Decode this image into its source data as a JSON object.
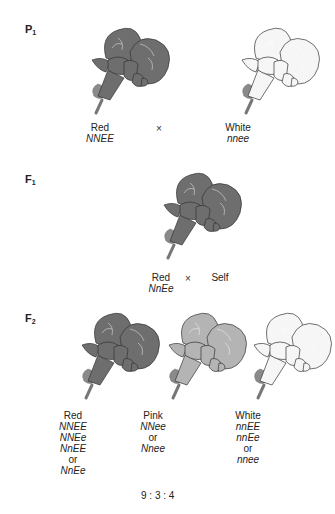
{
  "generations": {
    "p1": {
      "label": "P",
      "sub": "1"
    },
    "f1": {
      "label": "F",
      "sub": "1"
    },
    "f2": {
      "label": "F",
      "sub": "2"
    }
  },
  "p1": {
    "left": {
      "phenotype": "Red",
      "genotype": "NNEE",
      "color": "#6e6e6e"
    },
    "cross_symbol": "×",
    "right": {
      "phenotype": "White",
      "genotype": "nnee",
      "color": "#f6f6f6"
    }
  },
  "f1": {
    "phenotype": "Red",
    "genotype": "NnEe",
    "cross_symbol": "×",
    "self_label": "Self",
    "color": "#6e6e6e"
  },
  "f2": {
    "red": {
      "phenotype": "Red",
      "genotypes": [
        "NNEE",
        "NNEe",
        "NnEE",
        "or",
        "NnEe"
      ],
      "color": "#6e6e6e"
    },
    "pink": {
      "phenotype": "Pink",
      "genotypes": [
        "NNee",
        "or",
        "Nnee"
      ],
      "color": "#b4b4b4"
    },
    "white": {
      "phenotype": "White",
      "genotypes": [
        "nnEE",
        "nnEe",
        "or",
        "nnee"
      ],
      "color": "#f6f6f6"
    }
  },
  "ratio": "9 : 3 : 4",
  "icons": {
    "flower": "snapdragon-flower-illustration"
  }
}
